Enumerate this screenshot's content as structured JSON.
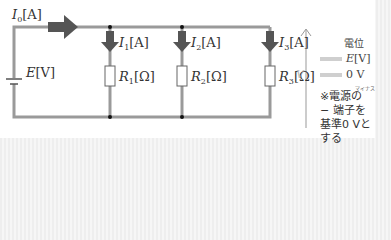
{
  "circuit": {
    "total_current": {
      "symbol": "I",
      "sub": "0",
      "unit": "[A]"
    },
    "source": {
      "symbol": "E",
      "unit": "[V]"
    },
    "branches": [
      {
        "current": {
          "symbol": "I",
          "sub": "1",
          "unit": "[A]"
        },
        "resistor": {
          "symbol": "R",
          "sub": "1",
          "unit": "[Ω]"
        }
      },
      {
        "current": {
          "symbol": "I",
          "sub": "2",
          "unit": "[A]"
        },
        "resistor": {
          "symbol": "R",
          "sub": "2",
          "unit": "[Ω]"
        }
      },
      {
        "current": {
          "symbol": "I",
          "sub": "3",
          "unit": "[A]"
        },
        "resistor": {
          "symbol": "R",
          "sub": "3",
          "unit": "[Ω]"
        }
      }
    ],
    "colors": {
      "wire": "#9a9a9a",
      "arrow": "#555555",
      "card": "#ffffff"
    }
  },
  "legend": {
    "axis_label": "V",
    "title": "電位",
    "high": {
      "symbol": "E",
      "unit": "[V]"
    },
    "low": {
      "label": "0 V"
    },
    "note_ruby": "マイナス",
    "note": "※電源の − 端子を基準0 Vとする"
  }
}
